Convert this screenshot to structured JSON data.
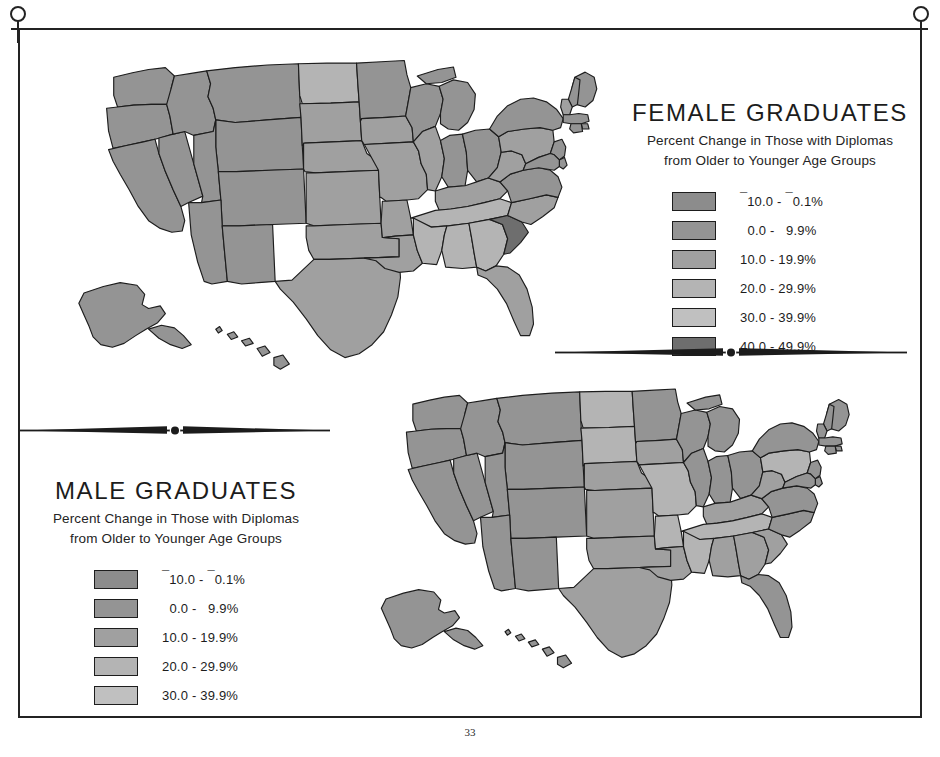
{
  "page": {
    "number": "33",
    "frame_color": "#232323",
    "background": "#ffffff"
  },
  "ornaments": {
    "venus_left_name": "venus-symbol-icon",
    "venus_right_name": "venus-symbol-icon",
    "divider_name": "decorative-divider"
  },
  "palette": {
    "class_neg10_to_neg01": "#8c8c8c",
    "class_0_to_99": "#949494",
    "class_10_to_199": "#a0a0a0",
    "class_20_to_299": "#b4b4b4",
    "class_30_to_399": "#c0c0c0",
    "class_40_to_499": "#6e6e6e",
    "outline": "#1d1d1d"
  },
  "female": {
    "title": "FEMALE GRADUATES",
    "subtitle_line1": "Percent Change in Those with Diplomas",
    "subtitle_line2": "from Older to Younger Age Groups",
    "legend": [
      {
        "label_pre": "10.0 - ",
        "label_post": "0.1%",
        "neg_first": true,
        "neg_second": true,
        "color": "#8c8c8c"
      },
      {
        "label_pre": "  0.0 -   9.9%",
        "label_post": "",
        "neg_first": false,
        "neg_second": false,
        "color": "#949494"
      },
      {
        "label_pre": "10.0 - 19.9%",
        "label_post": "",
        "neg_first": false,
        "neg_second": false,
        "color": "#a0a0a0"
      },
      {
        "label_pre": "20.0 - 29.9%",
        "label_post": "",
        "neg_first": false,
        "neg_second": false,
        "color": "#b4b4b4"
      },
      {
        "label_pre": "30.0 - 39.9%",
        "label_post": "",
        "neg_first": false,
        "neg_second": false,
        "color": "#c0c0c0"
      },
      {
        "label_pre": "40.0 - 49.9%",
        "label_post": "",
        "neg_first": false,
        "neg_second": false,
        "color": "#6e6e6e"
      }
    ]
  },
  "male": {
    "title": "MALE GRADUATES",
    "subtitle_line1": "Percent Change in Those with Diplomas",
    "subtitle_line2": "from Older to Younger Age Groups",
    "legend": [
      {
        "label_pre": "10.0 - ",
        "label_post": "0.1%",
        "neg_first": true,
        "neg_second": true,
        "color": "#8c8c8c"
      },
      {
        "label_pre": "  0.0 -   9.9%",
        "label_post": "",
        "neg_first": false,
        "neg_second": false,
        "color": "#949494"
      },
      {
        "label_pre": "10.0 - 19.9%",
        "label_post": "",
        "neg_first": false,
        "neg_second": false,
        "color": "#a0a0a0"
      },
      {
        "label_pre": "20.0 - 29.9%",
        "label_post": "",
        "neg_first": false,
        "neg_second": false,
        "color": "#b4b4b4"
      },
      {
        "label_pre": "30.0 - 39.9%",
        "label_post": "",
        "neg_first": false,
        "neg_second": false,
        "color": "#c0c0c0"
      }
    ]
  },
  "chart_data": {
    "type": "choropleth-map-pair",
    "title": "Percent Change in Those with Diplomas from Older to Younger Age Groups",
    "maps": [
      {
        "name": "FEMALE GRADUATES",
        "position": "upper",
        "classes": [
          "-10.0 - -0.1%",
          "0.0 - 9.9%",
          "10.0 - 19.9%",
          "20.0 - 29.9%",
          "30.0 - 39.9%",
          "40.0 - 49.9%"
        ],
        "class_colors": [
          "#8c8c8c",
          "#949494",
          "#a0a0a0",
          "#b4b4b4",
          "#c0c0c0",
          "#6e6e6e"
        ],
        "states": {
          "WA": 1,
          "OR": 1,
          "CA": 1,
          "NV": 1,
          "ID": 1,
          "MT": 1,
          "WY": 1,
          "UT": 1,
          "AZ": 1,
          "NM": 1,
          "CO": 1,
          "ND": 3,
          "SD": 2,
          "NE": 2,
          "KS": 2,
          "OK": 2,
          "TX": 2,
          "MN": 1,
          "IA": 2,
          "MO": 2,
          "AR": 2,
          "LA": 2,
          "WI": 1,
          "IL": 2,
          "MI": 1,
          "IN": 1,
          "OH": 1,
          "KY": 2,
          "TN": 3,
          "MS": 3,
          "AL": 3,
          "GA": 3,
          "FL": 2,
          "SC": 5,
          "NC": 2,
          "VA": 1,
          "WV": 2,
          "PA": 2,
          "NY": 1,
          "ME": 1,
          "NH": 1,
          "VT": 2,
          "MA": 1,
          "RI": 1,
          "CT": 1,
          "NJ": 1,
          "DE": 1,
          "MD": 1,
          "AK": 1,
          "HI": 1
        }
      },
      {
        "name": "MALE GRADUATES",
        "position": "lower",
        "classes": [
          "-10.0 - -0.1%",
          "0.0 - 9.9%",
          "10.0 - 19.9%",
          "20.0 - 29.9%",
          "30.0 - 39.9%"
        ],
        "class_colors": [
          "#8c8c8c",
          "#949494",
          "#a0a0a0",
          "#b4b4b4",
          "#c0c0c0"
        ],
        "states": {
          "WA": 1,
          "OR": 1,
          "CA": 1,
          "NV": 1,
          "ID": 1,
          "MT": 1,
          "WY": 1,
          "UT": 1,
          "AZ": 1,
          "NM": 1,
          "CO": 1,
          "ND": 3,
          "SD": 3,
          "NE": 2,
          "KS": 2,
          "OK": 2,
          "TX": 2,
          "MN": 1,
          "IA": 2,
          "MO": 3,
          "AR": 3,
          "LA": 2,
          "WI": 1,
          "IL": 1,
          "MI": 1,
          "IN": 1,
          "OH": 1,
          "KY": 2,
          "TN": 3,
          "MS": 3,
          "AL": 2,
          "GA": 2,
          "FL": 1,
          "SC": 2,
          "NC": 1,
          "VA": 1,
          "WV": 2,
          "PA": 3,
          "NY": 1,
          "ME": 1,
          "NH": 1,
          "VT": 1,
          "MA": 1,
          "RI": 1,
          "CT": 1,
          "NJ": 1,
          "DE": 1,
          "MD": 1,
          "AK": 1,
          "HI": 1
        }
      }
    ]
  }
}
